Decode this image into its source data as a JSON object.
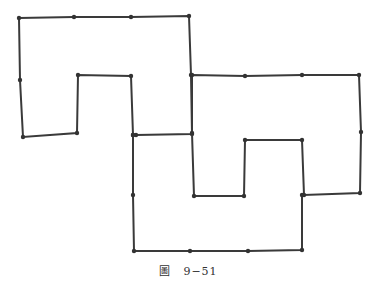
{
  "caption": "圖　9−51",
  "colors": {
    "line": "#3a3a3a",
    "dot": "#333333"
  },
  "shapes": [
    {
      "name": "shape-upper-left",
      "points": [
        [
          19,
          18
        ],
        [
          74,
          17
        ],
        [
          131,
          17
        ],
        [
          189,
          16
        ],
        [
          191,
          75
        ],
        [
          192,
          134
        ],
        [
          136,
          135
        ],
        [
          133,
          135
        ],
        [
          131,
          76
        ],
        [
          78,
          75
        ],
        [
          77,
          133
        ],
        [
          23,
          137
        ],
        [
          20,
          80
        ]
      ]
    },
    {
      "name": "shape-right",
      "points": [
        [
          192,
          75
        ],
        [
          245,
          76
        ],
        [
          302,
          75
        ],
        [
          359,
          75
        ],
        [
          361,
          132
        ],
        [
          360,
          193
        ],
        [
          304,
          195
        ],
        [
          302,
          140
        ],
        [
          245,
          140
        ],
        [
          244,
          196
        ],
        [
          194,
          196
        ],
        [
          192,
          133
        ]
      ]
    },
    {
      "name": "shape-bottom",
      "points": [
        [
          133,
          135
        ],
        [
          133,
          195
        ],
        [
          134,
          251
        ],
        [
          190,
          251
        ],
        [
          248,
          251
        ],
        [
          302,
          250
        ],
        [
          302,
          195
        ]
      ]
    }
  ]
}
